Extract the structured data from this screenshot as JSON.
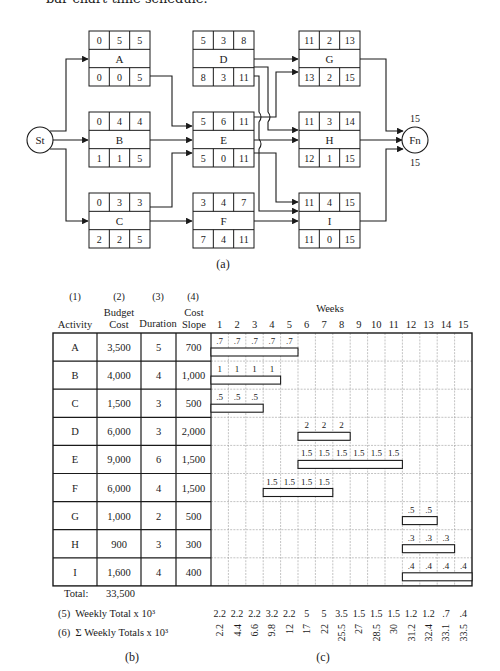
{
  "caption_top": "bar chart time schedule.",
  "network": {
    "label": "(a)",
    "start": "St",
    "finish": "Fn",
    "finish_early": "15",
    "finish_late": "15",
    "nodes": [
      {
        "id": "A",
        "top": [
          "0",
          "5",
          "5"
        ],
        "bottom": [
          "0",
          "0",
          "5"
        ]
      },
      {
        "id": "B",
        "top": [
          "0",
          "4",
          "4"
        ],
        "bottom": [
          "1",
          "1",
          "5"
        ]
      },
      {
        "id": "C",
        "top": [
          "0",
          "3",
          "3"
        ],
        "bottom": [
          "2",
          "2",
          "5"
        ]
      },
      {
        "id": "D",
        "top": [
          "5",
          "3",
          "8"
        ],
        "bottom": [
          "8",
          "3",
          "11"
        ]
      },
      {
        "id": "E",
        "top": [
          "5",
          "6",
          "11"
        ],
        "bottom": [
          "5",
          "0",
          "11"
        ]
      },
      {
        "id": "F",
        "top": [
          "3",
          "4",
          "7"
        ],
        "bottom": [
          "7",
          "4",
          "11"
        ]
      },
      {
        "id": "G",
        "top": [
          "11",
          "2",
          "13"
        ],
        "bottom": [
          "13",
          "2",
          "15"
        ]
      },
      {
        "id": "H",
        "top": [
          "11",
          "3",
          "14"
        ],
        "bottom": [
          "12",
          "1",
          "15"
        ]
      },
      {
        "id": "I",
        "top": [
          "11",
          "4",
          "15"
        ],
        "bottom": [
          "11",
          "0",
          "15"
        ]
      }
    ],
    "edges": [
      [
        "St",
        "A"
      ],
      [
        "St",
        "B"
      ],
      [
        "St",
        "C"
      ],
      [
        "A",
        "E"
      ],
      [
        "B",
        "E"
      ],
      [
        "C",
        "E"
      ],
      [
        "C",
        "F"
      ],
      [
        "D",
        "G"
      ],
      [
        "D",
        "H"
      ],
      [
        "D",
        "I"
      ],
      [
        "E",
        "G"
      ],
      [
        "E",
        "H"
      ],
      [
        "E",
        "I"
      ],
      [
        "F",
        "I"
      ],
      [
        "G",
        "Fn"
      ],
      [
        "H",
        "Fn"
      ],
      [
        "I",
        "Fn"
      ]
    ]
  },
  "table": {
    "label_b": "(b)",
    "label_c": "(c)",
    "col_numbers": [
      "(1)",
      "(2)",
      "(3)",
      "(4)"
    ],
    "headers": {
      "activity": "Activity",
      "budget_line1": "Budget",
      "budget_line2": "Cost",
      "duration": "Duration",
      "slope_line1": "Cost",
      "slope_line2": "Slope",
      "weeks": "Weeks"
    },
    "weeks": [
      "1",
      "2",
      "3",
      "4",
      "5",
      "6",
      "7",
      "8",
      "9",
      "10",
      "11",
      "12",
      "13",
      "14",
      "15"
    ],
    "rows": [
      {
        "activity": "A",
        "budget": "3,500",
        "duration": "5",
        "slope": "700",
        "start": 1,
        "length": 5,
        "weekly": [
          ".7",
          ".7",
          ".7",
          ".7",
          ".7"
        ]
      },
      {
        "activity": "B",
        "budget": "4,000",
        "duration": "4",
        "slope": "1,000",
        "start": 1,
        "length": 4,
        "weekly": [
          "1",
          "1",
          "1",
          "1"
        ]
      },
      {
        "activity": "C",
        "budget": "1,500",
        "duration": "3",
        "slope": "500",
        "start": 1,
        "length": 3,
        "weekly": [
          ".5",
          ".5",
          ".5"
        ]
      },
      {
        "activity": "D",
        "budget": "6,000",
        "duration": "3",
        "slope": "2,000",
        "start": 6,
        "length": 3,
        "weekly": [
          "2",
          "2",
          "2"
        ]
      },
      {
        "activity": "E",
        "budget": "9,000",
        "duration": "6",
        "slope": "1,500",
        "start": 6,
        "length": 6,
        "weekly": [
          "1.5",
          "1.5",
          "1.5",
          "1.5",
          "1.5",
          "1.5"
        ]
      },
      {
        "activity": "F",
        "budget": "6,000",
        "duration": "4",
        "slope": "1,500",
        "start": 4,
        "length": 4,
        "weekly": [
          "1.5",
          "1.5",
          "1.5",
          "1.5"
        ]
      },
      {
        "activity": "G",
        "budget": "1,000",
        "duration": "2",
        "slope": "500",
        "start": 12,
        "length": 2,
        "weekly": [
          ".5",
          ".5"
        ]
      },
      {
        "activity": "H",
        "budget": "900",
        "duration": "3",
        "slope": "300",
        "start": 12,
        "length": 3,
        "weekly": [
          ".3",
          ".3",
          ".3"
        ]
      },
      {
        "activity": "I",
        "budget": "1,600",
        "duration": "4",
        "slope": "400",
        "start": 12,
        "length": 4,
        "weekly": [
          ".4",
          ".4",
          ".4",
          ".4"
        ]
      }
    ],
    "total_label": "Total:",
    "total_value": "33,500",
    "weekly_total_label": "(5)  Weekly Total x 10³",
    "cumulative_label": "(6)  Σ Weekly Totals x 10³",
    "weekly_totals": [
      "2.2",
      "2.2",
      "2.2",
      "3.2",
      "2.2",
      "5",
      "5",
      "3.5",
      "1.5",
      "1.5",
      "1.5",
      "1.2",
      "1.2",
      ".7",
      ".4"
    ],
    "cumulative_totals": [
      "2.2",
      "4.4",
      "6.6",
      "9.8",
      "12",
      "17",
      "22",
      "25.5",
      "27",
      "28.5",
      "30",
      "31.2",
      "32.4",
      "33.1",
      "33.5"
    ]
  }
}
